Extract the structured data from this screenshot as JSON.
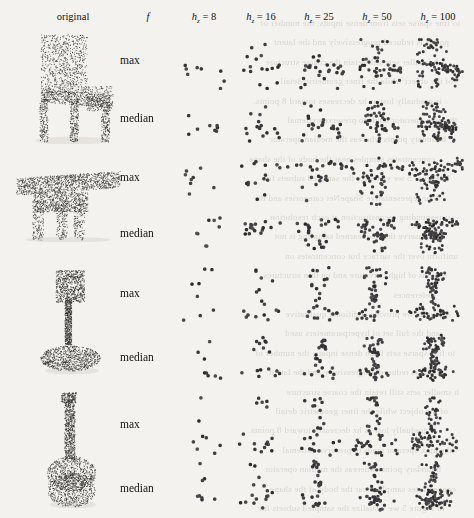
{
  "figure": {
    "background": "#f4f2ee",
    "point_color": "#3b3a38"
  },
  "header": {
    "col_original": "original",
    "col_f": "f",
    "columns": [
      {
        "label": "h",
        "sub": "z",
        "eq": " = 8",
        "value": 8
      },
      {
        "label": "h",
        "sub": "z",
        "eq": " = 16",
        "value": 16
      },
      {
        "label": "h",
        "sub": "z",
        "eq": " = 25",
        "value": 25
      },
      {
        "label": "h",
        "sub": "z",
        "eq": " = 50",
        "value": 50
      },
      {
        "label": "h",
        "sub": "z",
        "eq": " = 100",
        "value": 100
      }
    ]
  },
  "rows": [
    {
      "object": "chair",
      "functions": [
        "max",
        "median"
      ]
    },
    {
      "object": "table",
      "functions": [
        "max",
        "median"
      ]
    },
    {
      "object": "lamp",
      "functions": [
        "max",
        "median"
      ]
    },
    {
      "object": "guitar",
      "functions": [
        "max",
        "median"
      ]
    }
  ],
  "chart_data": {
    "type": "scatter",
    "xlabel": "",
    "ylabel": "",
    "grid": false,
    "legend_position": "none",
    "col_categories": [
      "original",
      "f",
      "hz = 8",
      "hz = 16",
      "hz = 25",
      "hz = 50",
      "hz = 100"
    ],
    "row_categories": [
      "chair / max",
      "chair / median",
      "table / max",
      "table / median",
      "lamp / max",
      "lamp / median",
      "guitar / max",
      "guitar / median"
    ],
    "point_counts": {
      "chair": {
        "max": [
          8,
          16,
          25,
          50,
          100
        ],
        "median": [
          8,
          16,
          25,
          50,
          100
        ]
      },
      "table": {
        "max": [
          8,
          16,
          25,
          50,
          100
        ],
        "median": [
          8,
          16,
          25,
          50,
          100
        ]
      },
      "lamp": {
        "max": [
          8,
          16,
          25,
          50,
          100
        ],
        "median": [
          8,
          16,
          25,
          50,
          100
        ]
      },
      "guitar": {
        "max": [
          8,
          16,
          25,
          50,
          100
        ],
        "median": [
          8,
          16,
          25,
          50,
          100
        ]
      }
    },
    "original_point_count": 2048,
    "note": "Each cell shows a sparsified point cloud with hz points, pooled with either max or median."
  },
  "bleed_lines": [
    "to fine sparse sets from dense inputs; the number of",
    "points is reduced progressively and the latent",
    "h smaller sets still retain the coarse structure",
    "of the object while the finer geometric detail",
    "is gradually lost as hz decreases toward 8 points.",
    "the max operator tends to preserve extremal",
    "boundary points whereas the median operator",
    "concentrates samples near the body of the shape.",
    "In Figure 5 we visualize the sampled subsets for",
    "four representative ShapeNet categories and the",
    "corresponding reconstruction at each resolution.",
    "We observe that the learned sampling is not",
    "uniform over the surface but concentrates on",
    "regions of high curvature and on thin structures.",
    "References",
    "appendix we provide additional qualitative",
    "and the full set of hyperparameters used"
  ]
}
